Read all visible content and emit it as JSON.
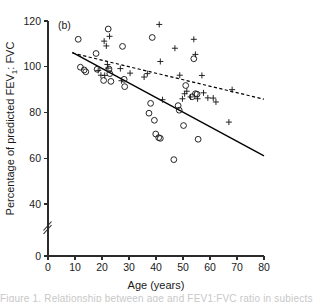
{
  "figure": {
    "panel_label": "(b)",
    "caption_partial": "Figure 1. Relationship between age and FEV1:FVC ratio in subjects"
  },
  "chart_data": {
    "type": "scatter",
    "title": "",
    "panel": "(b)",
    "xlabel": "Age (years)",
    "ylabel": "Percentage of predicted FEV₁: FVC",
    "xlim": [
      0,
      80
    ],
    "ylim": [
      0,
      120
    ],
    "y_axis_break": true,
    "y_break_between": [
      0,
      40
    ],
    "xticks": [
      0,
      10,
      20,
      30,
      40,
      50,
      60,
      70,
      80
    ],
    "xticklabels": [
      "0",
      "10",
      "20",
      "30",
      "40",
      "50",
      "60",
      "70",
      "80"
    ],
    "yticks": [
      0,
      40,
      60,
      80,
      100,
      120
    ],
    "yticklabels": [
      "0",
      "40",
      "60",
      "80",
      "100",
      "120"
    ],
    "grid": false,
    "legend": "none",
    "series": [
      {
        "name": "circle-group",
        "marker": "circle",
        "points": [
          [
            11.2,
            112.0
          ],
          [
            12.0,
            99.8
          ],
          [
            13.4,
            98.6
          ],
          [
            14.0,
            97.8
          ],
          [
            17.8,
            105.8
          ],
          [
            18.2,
            98.9
          ],
          [
            20.6,
            94.0
          ],
          [
            22.3,
            116.5
          ],
          [
            22.6,
            99.0
          ],
          [
            22.9,
            97.0
          ],
          [
            23.3,
            93.6
          ],
          [
            27.6,
            108.9
          ],
          [
            28.2,
            94.5
          ],
          [
            28.4,
            91.3
          ],
          [
            37.4,
            79.7
          ],
          [
            38.0,
            84.0
          ],
          [
            38.6,
            112.8
          ],
          [
            39.4,
            76.6
          ],
          [
            39.9,
            70.6
          ],
          [
            41.0,
            69.0
          ],
          [
            41.6,
            68.7
          ],
          [
            46.6,
            59.4
          ],
          [
            48.2,
            83.0
          ],
          [
            48.6,
            81.0
          ],
          [
            50.2,
            74.3
          ],
          [
            51.0,
            91.8
          ],
          [
            53.4,
            86.9
          ],
          [
            54.0,
            103.5
          ],
          [
            54.6,
            88.2
          ],
          [
            55.2,
            88.0
          ],
          [
            55.6,
            68.3
          ]
        ]
      },
      {
        "name": "plus-group",
        "marker": "plus",
        "points": [
          [
            18.6,
            98.4
          ],
          [
            19.6,
            96.3
          ],
          [
            20.8,
            111.2
          ],
          [
            21.0,
            96.2
          ],
          [
            21.6,
            109.1
          ],
          [
            22.0,
            101.0
          ],
          [
            22.2,
            99.4
          ],
          [
            22.8,
            113.3
          ],
          [
            26.8,
            99.2
          ],
          [
            27.2,
            93.9
          ],
          [
            30.4,
            97.2
          ],
          [
            35.6,
            95.5
          ],
          [
            36.8,
            97.0
          ],
          [
            41.2,
            118.5
          ],
          [
            41.6,
            102.3
          ],
          [
            42.4,
            85.6
          ],
          [
            47.0,
            108.1
          ],
          [
            48.8,
            96.3
          ],
          [
            49.8,
            86.0
          ],
          [
            50.6,
            88.2
          ],
          [
            51.4,
            89.3
          ],
          [
            52.8,
            86.8
          ],
          [
            54.0,
            112.0
          ],
          [
            54.6,
            105.4
          ],
          [
            55.4,
            86.0
          ],
          [
            57.0,
            96.2
          ],
          [
            57.6,
            88.6
          ],
          [
            59.2,
            86.4
          ],
          [
            61.2,
            86.3
          ],
          [
            62.2,
            84.6
          ],
          [
            67.0,
            75.8
          ],
          [
            68.2,
            90.0
          ]
        ]
      }
    ],
    "fit_lines": [
      {
        "name": "solid-regression",
        "style": "solid",
        "x": [
          9.0,
          80.0
        ],
        "y": [
          106.3,
          61.0
        ]
      },
      {
        "name": "dashed-regression",
        "style": "dashed",
        "x": [
          9.0,
          80.0
        ],
        "y": [
          106.0,
          85.8
        ]
      }
    ]
  }
}
